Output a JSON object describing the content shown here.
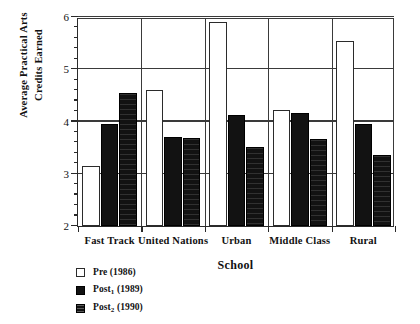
{
  "chart_data": {
    "type": "bar",
    "title": "",
    "xlabel": "School",
    "ylabel_line1": "Average Practical Arts",
    "ylabel_line2": "Credits Earned",
    "categories": [
      "Fast Track",
      "United Nations",
      "Urban",
      "Middle Class",
      "Rural"
    ],
    "series": [
      {
        "name": "Pre (1986)",
        "name_base": "Pre",
        "name_sub": "",
        "name_year": "(1986)",
        "style": "open",
        "values": [
          3.15,
          4.6,
          5.9,
          4.22,
          5.55
        ]
      },
      {
        "name": "Post1 (1989)",
        "name_base": "Post",
        "name_sub": "1",
        "name_year": "(1989)",
        "style": "solid",
        "values": [
          3.95,
          3.7,
          4.12,
          4.17,
          3.95
        ]
      },
      {
        "name": "Post2 (1990)",
        "name_base": "Post",
        "name_sub": "2",
        "name_year": "(1990)",
        "style": "hatched",
        "values": [
          4.55,
          3.68,
          3.52,
          3.67,
          3.35
        ]
      }
    ],
    "ylim": [
      2,
      6
    ],
    "ytick_major": [
      2,
      3,
      4,
      5,
      6
    ],
    "ytick_labels": [
      "2",
      "3",
      "4",
      "5",
      "6"
    ],
    "ytick_minor_step": 0.2,
    "grid": "horizontal-major",
    "legend_position": "below-left",
    "axis_color": "#2a2a2a",
    "grid_color": "#3a3a3a",
    "bar_fill_open": "#ffffff",
    "bar_fill_solid": "#121212"
  }
}
